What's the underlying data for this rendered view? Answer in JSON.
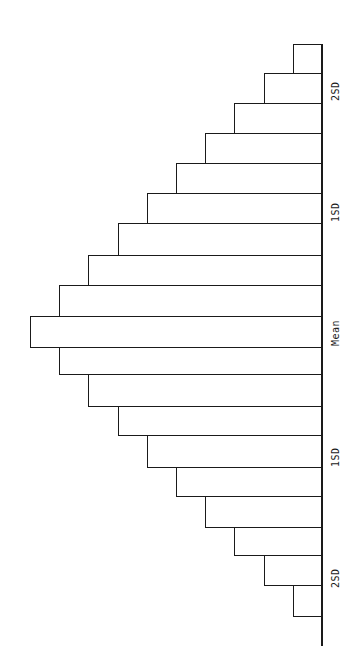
{
  "chart_data": {
    "type": "bar",
    "orientation": "horizontal (rotated 90°, baseline on right)",
    "title": "",
    "xlabel": "",
    "ylabel": "",
    "categories": [
      "b1",
      "b2",
      "b3",
      "b4",
      "b5",
      "b6",
      "b7",
      "b8",
      "b9",
      "Mean",
      "b11",
      "b12",
      "b13",
      "b14",
      "b15",
      "b16",
      "b17",
      "b18",
      "b19"
    ],
    "values": [
      1,
      2,
      3,
      4,
      5,
      6,
      7,
      8,
      9,
      10,
      9,
      8,
      7,
      6,
      5,
      4,
      3,
      2,
      1
    ],
    "tick_labels": [
      {
        "label": "2SD",
        "position_index": 1.5
      },
      {
        "label": "1SD",
        "position_index": 5.5
      },
      {
        "label": "Mean",
        "position_index": 9
      },
      {
        "label": "1SD",
        "position_index": 12.5
      },
      {
        "label": "2SD",
        "position_index": 16.5
      }
    ],
    "grid": false,
    "legend": null
  },
  "layout": {
    "baseline_x": 322,
    "unit_px": 29.2,
    "bars_y": [
      44,
      73,
      103,
      133,
      163,
      193,
      223,
      255,
      285,
      316,
      347,
      374,
      406,
      435,
      467,
      496,
      527,
      555,
      585,
      616
    ]
  },
  "labels": {
    "top_2sd": "2SD",
    "top_1sd": "1SD",
    "mean": "Mean",
    "bottom_1sd": "1SD",
    "bottom_2sd": "2SD"
  },
  "colors": {
    "line": "#1a1a1a",
    "background": "#ffffff"
  }
}
